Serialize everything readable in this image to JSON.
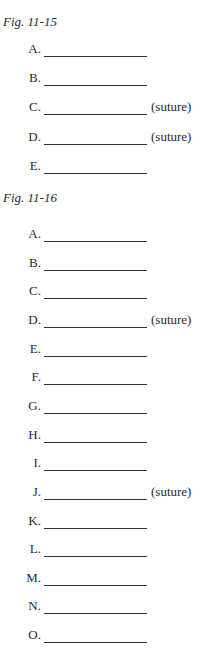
{
  "sections": [
    {
      "heading": "Fig. 11-15",
      "items": [
        {
          "label": "A.",
          "note": ""
        },
        {
          "label": "B.",
          "note": ""
        },
        {
          "label": "C.",
          "note": "(suture)"
        },
        {
          "label": "D.",
          "note": "(suture)"
        },
        {
          "label": "E.",
          "note": ""
        }
      ]
    },
    {
      "heading": "Fig. 11-16",
      "items": [
        {
          "label": "A.",
          "note": ""
        },
        {
          "label": "B.",
          "note": ""
        },
        {
          "label": "C.",
          "note": ""
        },
        {
          "label": "D.",
          "note": "(suture)"
        },
        {
          "label": "E.",
          "note": ""
        },
        {
          "label": "F.",
          "note": ""
        },
        {
          "label": "G.",
          "note": ""
        },
        {
          "label": "H.",
          "note": ""
        },
        {
          "label": "I.",
          "note": ""
        },
        {
          "label": "J.",
          "note": "(suture)"
        },
        {
          "label": "K.",
          "note": ""
        },
        {
          "label": "L.",
          "note": ""
        },
        {
          "label": "M.",
          "note": ""
        },
        {
          "label": "N.",
          "note": ""
        },
        {
          "label": "O.",
          "note": ""
        }
      ]
    }
  ]
}
